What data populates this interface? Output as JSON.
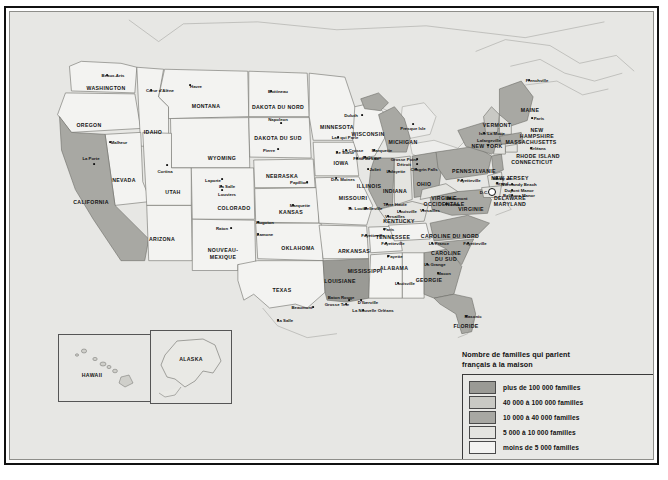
{
  "map": {
    "title_hidden": "",
    "legend": {
      "title": "Nombre de familles qui parlent français à la maison",
      "title_line1": "Nombre de familles qui parlent",
      "title_line2": "français à la maison",
      "items": [
        {
          "label": "plus de 100 000 familles",
          "color": "#9a9a95"
        },
        {
          "label": "40 000 à 100 000 familles",
          "color": "#c9c9c4"
        },
        {
          "label": "10 000 à 40 000 familles",
          "color": "#a8a8a3"
        },
        {
          "label": "5 000 à 10 000 familles",
          "color": "#e4e4e0"
        },
        {
          "label": "moins de 5 000 familles",
          "color": "#f3f3f1"
        }
      ]
    },
    "insets": [
      {
        "name": "hawaii",
        "label": "HAWAII"
      },
      {
        "name": "alaska",
        "label": "ALASKA"
      }
    ],
    "states": [
      {
        "label": "WASHINGTON",
        "x": 96,
        "y": 76,
        "size": "normal"
      },
      {
        "label": "OREGON",
        "x": 79,
        "y": 113,
        "size": "normal"
      },
      {
        "label": "IDAHO",
        "x": 143,
        "y": 120,
        "size": "normal"
      },
      {
        "label": "MONTANA",
        "x": 196,
        "y": 94,
        "size": "normal"
      },
      {
        "label": "NEVADA",
        "x": 114,
        "y": 168,
        "size": "normal"
      },
      {
        "label": "CALIFORNIA",
        "x": 81,
        "y": 190,
        "size": "normal"
      },
      {
        "label": "UTAH",
        "x": 163,
        "y": 180,
        "size": "normal"
      },
      {
        "label": "ARIZONA",
        "x": 152,
        "y": 227,
        "size": "normal"
      },
      {
        "label": "NOUVEAU-",
        "x": 213,
        "y": 238,
        "size": "normal"
      },
      {
        "label": "MEXIQUE",
        "x": 213,
        "y": 245,
        "size": "normal"
      },
      {
        "label": "WYOMING",
        "x": 212,
        "y": 146,
        "size": "normal"
      },
      {
        "label": "COLORADO",
        "x": 224,
        "y": 196,
        "size": "normal"
      },
      {
        "label": "DAKOTA DU NORD",
        "x": 268,
        "y": 95,
        "size": "normal"
      },
      {
        "label": "DAKOTA DU SUD",
        "x": 268,
        "y": 126,
        "size": "normal"
      },
      {
        "label": "NEBRASKA",
        "x": 272,
        "y": 164,
        "size": "normal"
      },
      {
        "label": "KANSAS",
        "x": 281,
        "y": 200,
        "size": "normal"
      },
      {
        "label": "OKLAHOMA",
        "x": 288,
        "y": 236,
        "size": "normal"
      },
      {
        "label": "TEXAS",
        "x": 272,
        "y": 278,
        "size": "normal"
      },
      {
        "label": "MINNESOTA",
        "x": 327,
        "y": 115,
        "size": "normal"
      },
      {
        "label": "IOWA",
        "x": 331,
        "y": 151,
        "size": "normal"
      },
      {
        "label": "MISSOURI",
        "x": 343,
        "y": 186,
        "size": "normal"
      },
      {
        "label": "ARKANSAS",
        "x": 344,
        "y": 239,
        "size": "normal"
      },
      {
        "label": "WISCONSIN",
        "x": 358,
        "y": 122,
        "size": "normal"
      },
      {
        "label": "ILLINOIS",
        "x": 359,
        "y": 174,
        "size": "normal"
      },
      {
        "label": "INDIANA",
        "x": 385,
        "y": 179,
        "size": "normal"
      },
      {
        "label": "MICHIGAN",
        "x": 393,
        "y": 130,
        "size": "normal"
      },
      {
        "label": "OHIO",
        "x": 414,
        "y": 172,
        "size": "normal"
      },
      {
        "label": "KENTUCKY",
        "x": 389,
        "y": 209,
        "size": "normal"
      },
      {
        "label": "TENNESSEE",
        "x": 383,
        "y": 225,
        "size": "normal"
      },
      {
        "label": "MISSISSIPPI",
        "x": 355,
        "y": 259,
        "size": "normal"
      },
      {
        "label": "ALABAMA",
        "x": 384,
        "y": 256,
        "size": "normal"
      },
      {
        "label": "LOUISIANE",
        "x": 330,
        "y": 269,
        "size": "normal"
      },
      {
        "label": "GEORGIE",
        "x": 419,
        "y": 268,
        "size": "normal"
      },
      {
        "label": "FLORIDE",
        "x": 456,
        "y": 314,
        "size": "normal"
      },
      {
        "label": "CAROLINE DU NORD",
        "x": 440,
        "y": 224,
        "size": "normal"
      },
      {
        "label": "CAROLINE",
        "x": 436,
        "y": 241,
        "size": "normal"
      },
      {
        "label": "DU SUD",
        "x": 436,
        "y": 247,
        "size": "normal"
      },
      {
        "label": "VIRGINIE",
        "x": 461,
        "y": 197,
        "size": "normal"
      },
      {
        "label": "VIRGINIE",
        "x": 434,
        "y": 186,
        "size": "normal"
      },
      {
        "label": "OCCIDENTALE",
        "x": 434,
        "y": 192,
        "size": "normal"
      },
      {
        "label": "PENNSYLVANIE",
        "x": 464,
        "y": 159,
        "size": "normal"
      },
      {
        "label": "NEW YORK",
        "x": 477,
        "y": 134,
        "size": "normal"
      },
      {
        "label": "NEW JERSEY",
        "x": 500,
        "y": 166,
        "size": "normal"
      },
      {
        "label": "DELAWARE",
        "x": 500,
        "y": 186,
        "size": "normal"
      },
      {
        "label": "MARYLAND",
        "x": 500,
        "y": 192,
        "size": "normal"
      },
      {
        "label": "VERMONT",
        "x": 487,
        "y": 113,
        "size": "normal"
      },
      {
        "label": "MAINE",
        "x": 520,
        "y": 98,
        "size": "normal"
      },
      {
        "label": "NEW",
        "x": 527,
        "y": 118,
        "size": "normal"
      },
      {
        "label": "HAMPSHIRE",
        "x": 527,
        "y": 124,
        "size": "normal"
      },
      {
        "label": "MASSACHUSETTS",
        "x": 521,
        "y": 130,
        "size": "normal"
      },
      {
        "label": "RHODE ISLAND",
        "x": 528,
        "y": 144,
        "size": "normal"
      },
      {
        "label": "CONNECTICUT",
        "x": 522,
        "y": 150,
        "size": "normal"
      }
    ],
    "cities": [
      {
        "label": "Beaux-Arts",
        "x": 103,
        "y": 63,
        "dx": 97,
        "dy": 63
      },
      {
        "label": "Cœur d'Alène",
        "x": 150,
        "y": 78,
        "dx": 141,
        "dy": 78
      },
      {
        "label": "Havre",
        "x": 186,
        "y": 74,
        "dx": 180,
        "dy": 73
      },
      {
        "label": "Malheur",
        "x": 109,
        "y": 130,
        "dx": 100,
        "dy": 130
      },
      {
        "label": "La Porte",
        "x": 81,
        "y": 146,
        "dx": 84,
        "dy": 152
      },
      {
        "label": "Cortina",
        "x": 155,
        "y": 159,
        "dx": 157,
        "dy": 153
      },
      {
        "label": "Bottineau",
        "x": 268,
        "y": 79,
        "dx": 261,
        "dy": 79
      },
      {
        "label": "Napoleon",
        "x": 268,
        "y": 107,
        "dx": 271,
        "dy": 111
      },
      {
        "label": "Pierre",
        "x": 259,
        "y": 138,
        "dx": 268,
        "dy": 137
      },
      {
        "label": "Duluth",
        "x": 341,
        "y": 103,
        "dx": 352,
        "dy": 103
      },
      {
        "label": "Lac qui Parle",
        "x": 335,
        "y": 125,
        "dx": 328,
        "dy": 125
      },
      {
        "label": "Le Sueur",
        "x": 335,
        "y": 140,
        "dx": 327,
        "dy": 140
      },
      {
        "label": "Dubuque",
        "x": 362,
        "y": 145,
        "dx": 355,
        "dy": 145
      },
      {
        "label": "La Crosse",
        "x": 343,
        "y": 138,
        "dx": 336,
        "dy": 138
      },
      {
        "label": "Marquette",
        "x": 372,
        "y": 138,
        "dx": 364,
        "dy": 138
      },
      {
        "label": "Fond du Lac",
        "x": 356,
        "y": 146,
        "dx": 347,
        "dy": 146
      },
      {
        "label": "Presque Isle",
        "x": 403,
        "y": 116,
        "dx": 403,
        "dy": 112
      },
      {
        "label": "Grosse Point",
        "x": 394,
        "y": 147,
        "dx": 407,
        "dy": 147
      },
      {
        "label": "Détroit",
        "x": 394,
        "y": 152,
        "dx": 407,
        "dy": 152
      },
      {
        "label": "Joliet",
        "x": 365,
        "y": 157,
        "dx": 358,
        "dy": 157
      },
      {
        "label": "Lafayette",
        "x": 386,
        "y": 159,
        "dx": 379,
        "dy": 159
      },
      {
        "label": "Chagrin Falls",
        "x": 414,
        "y": 157,
        "dx": 406,
        "dy": 157
      },
      {
        "label": "Terre Haute",
        "x": 385,
        "y": 192,
        "dx": 377,
        "dy": 192
      },
      {
        "label": "Des Moines",
        "x": 333,
        "y": 167,
        "dx": 326,
        "dy": 166
      },
      {
        "label": "Papillion",
        "x": 289,
        "y": 170,
        "dx": 297,
        "dy": 170
      },
      {
        "label": "Laporte",
        "x": 203,
        "y": 168,
        "dx": 212,
        "dy": 167
      },
      {
        "label": "La Salle",
        "x": 217,
        "y": 174,
        "dx": 211,
        "dy": 174
      },
      {
        "label": "Louviers",
        "x": 217,
        "y": 182,
        "dx": 212,
        "dy": 178
      },
      {
        "label": "Marquette",
        "x": 290,
        "y": 193,
        "dx": 283,
        "dy": 193
      },
      {
        "label": "Hugoton",
        "x": 255,
        "y": 210,
        "dx": 248,
        "dy": 210
      },
      {
        "label": "Raton",
        "x": 212,
        "y": 216,
        "dx": 221,
        "dy": 216
      },
      {
        "label": "Lamone",
        "x": 255,
        "y": 222,
        "dx": 248,
        "dy": 222
      },
      {
        "label": "St. Louis",
        "x": 347,
        "y": 196,
        "dx": 340,
        "dy": 196
      },
      {
        "label": "Belleville",
        "x": 363,
        "y": 196,
        "dx": 356,
        "dy": 196
      },
      {
        "label": "Fayetteville",
        "x": 363,
        "y": 223,
        "dx": 356,
        "dy": 223
      },
      {
        "label": "Louisville",
        "x": 397,
        "y": 199,
        "dx": 390,
        "dy": 199
      },
      {
        "label": "Paris",
        "x": 379,
        "y": 217,
        "dx": 374,
        "dy": 217
      },
      {
        "label": "Versailles",
        "x": 385,
        "y": 204,
        "dx": 378,
        "dy": 204
      },
      {
        "label": "Fayetteville",
        "x": 383,
        "y": 231,
        "dx": 376,
        "dy": 231
      },
      {
        "label": "Payette",
        "x": 385,
        "y": 244,
        "dx": 378,
        "dy": 244
      },
      {
        "label": "La Grange",
        "x": 425,
        "y": 252,
        "dx": 417,
        "dy": 252
      },
      {
        "label": "Macon",
        "x": 434,
        "y": 261,
        "dx": 428,
        "dy": 261
      },
      {
        "label": "Louisville",
        "x": 395,
        "y": 271,
        "dx": 388,
        "dy": 271
      },
      {
        "label": "La France",
        "x": 429,
        "y": 231,
        "dx": 422,
        "dy": 231
      },
      {
        "label": "Fayetteville",
        "x": 465,
        "y": 231,
        "dx": 458,
        "dy": 231
      },
      {
        "label": "Fayetteville",
        "x": 459,
        "y": 168,
        "dx": 452,
        "dy": 168
      },
      {
        "label": "Beaumont",
        "x": 292,
        "y": 295,
        "dx": 303,
        "dy": 295
      },
      {
        "label": "La Salle",
        "x": 275,
        "y": 308,
        "dx": 268,
        "dy": 308
      },
      {
        "label": "Baton Rouge",
        "x": 331,
        "y": 285,
        "dx": 339,
        "dy": 288
      },
      {
        "label": "Grosse Tete",
        "x": 327,
        "y": 292,
        "dx": 336,
        "dy": 292
      },
      {
        "label": "D'Iberville",
        "x": 358,
        "y": 290,
        "dx": 351,
        "dy": 288
      },
      {
        "label": "La Nouvelle Orléans",
        "x": 363,
        "y": 298,
        "dx": 353,
        "dy": 298
      },
      {
        "label": "Masonic",
        "x": 463,
        "y": 304,
        "dx": 456,
        "dy": 304
      },
      {
        "label": "Paris",
        "x": 529,
        "y": 106,
        "dx": 522,
        "dy": 106
      },
      {
        "label": "Frenchville",
        "x": 527,
        "y": 68,
        "dx": 519,
        "dy": 68
      },
      {
        "label": "Isle La Motte",
        "x": 482,
        "y": 121,
        "dx": 474,
        "dy": 121
      },
      {
        "label": "Lafargeville",
        "x": 479,
        "y": 128,
        "dx": 478,
        "dy": 133
      },
      {
        "label": "Orléans",
        "x": 528,
        "y": 136,
        "dx": 521,
        "dy": 136
      },
      {
        "label": "Normandy Beach",
        "x": 509,
        "y": 172,
        "dx": 502,
        "dy": 172
      },
      {
        "label": "Dupont Manor",
        "x": 509,
        "y": 178,
        "dx": 502,
        "dy": 178
      },
      {
        "label": "Bellevue Manor",
        "x": 509,
        "y": 183,
        "dx": 502,
        "dy": 183
      },
      {
        "label": "Henry de",
        "x": 492,
        "y": 166,
        "dx": 487,
        "dy": 166
      },
      {
        "label": "Grand",
        "x": 492,
        "y": 171,
        "dx": 487,
        "dy": 171
      },
      {
        "label": "Beaumont",
        "x": 447,
        "y": 186,
        "dx": 440,
        "dy": 186
      },
      {
        "label": "Florida",
        "x": 443,
        "y": 192,
        "dx": 436,
        "dy": 192
      },
      {
        "label": "Versailles",
        "x": 420,
        "y": 198,
        "dx": 413,
        "dy": 198
      },
      {
        "label": "D.C.",
        "x": 474,
        "y": 180,
        "dx": 0,
        "dy": 0
      }
    ]
  }
}
